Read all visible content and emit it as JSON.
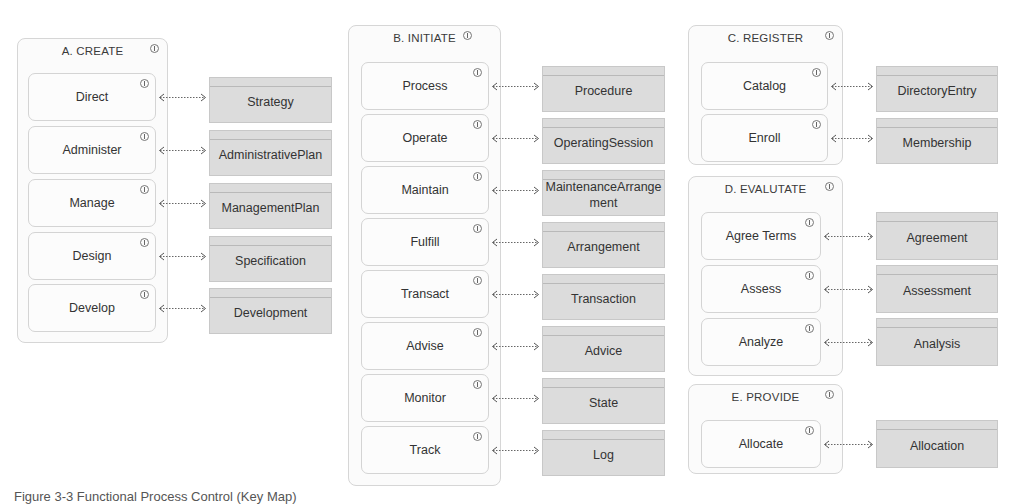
{
  "groups": [
    {
      "title": "A. CREATE",
      "processes": [
        {
          "label": "Direct",
          "entity": "Strategy"
        },
        {
          "label": "Administer",
          "entity": "AdministrativePlan"
        },
        {
          "label": "Manage",
          "entity": "ManagementPlan"
        },
        {
          "label": "Design",
          "entity": "Specification"
        },
        {
          "label": "Develop",
          "entity": "Development"
        }
      ]
    },
    {
      "title": "B. INITIATE",
      "processes": [
        {
          "label": "Process",
          "entity": "Procedure"
        },
        {
          "label": "Operate",
          "entity": "OperatingSession"
        },
        {
          "label": "Maintain",
          "entity": "MaintenanceArrangement"
        },
        {
          "label": "Fulfill",
          "entity": "Arrangement"
        },
        {
          "label": "Transact",
          "entity": "Transaction"
        },
        {
          "label": "Advise",
          "entity": "Advice"
        },
        {
          "label": "Monitor",
          "entity": "State"
        },
        {
          "label": "Track",
          "entity": "Log"
        }
      ]
    },
    {
      "title": "C. REGISTER",
      "processes": [
        {
          "label": "Catalog",
          "entity": "DirectoryEntry"
        },
        {
          "label": "Enroll",
          "entity": "Membership"
        }
      ]
    },
    {
      "title": "D. EVALUTATE",
      "processes": [
        {
          "label": "Agree Terms",
          "entity": "Agreement"
        },
        {
          "label": "Assess",
          "entity": "Assessment"
        },
        {
          "label": "Analyze",
          "entity": "Analysis"
        }
      ]
    },
    {
      "title": "E. PROVIDE",
      "processes": [
        {
          "label": "Allocate",
          "entity": "Allocation"
        }
      ]
    }
  ],
  "icons": {
    "group_info": "info-icon",
    "process_info": "info-icon",
    "connector": "bidirectional-dotted-arrow"
  },
  "colors": {
    "entity_fill": "#dcdcdc",
    "group_border": "#d6d6d6",
    "text": "#333333"
  },
  "caption": "Figure 3-3 Functional Process Control (Key Map)"
}
